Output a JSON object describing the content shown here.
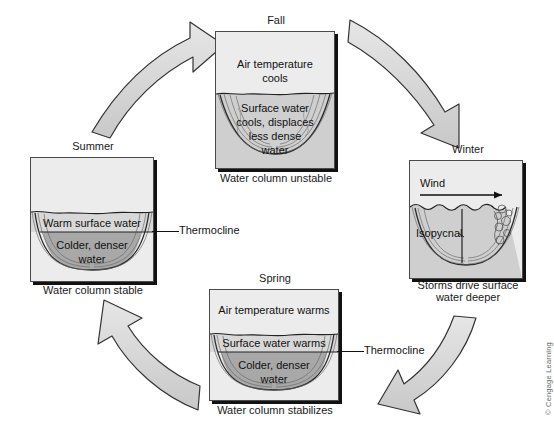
{
  "figure": {
    "copyright": "© Cengage Learning",
    "background": "#ffffff",
    "arrow_fill": "#d2d2d2",
    "arrow_stroke": "#333333",
    "sky_color": "#ececec",
    "mixed_water_color": "#cfcfcf",
    "warm_layer_color": "#d8d8d8",
    "cold_layer_color": "#a8a8a8"
  },
  "panels": {
    "fall": {
      "title": "Fall",
      "caption": "Water column unstable",
      "sky_text": "Air temperature\ncools",
      "sky_line1": "Air temperature",
      "sky_line2": "cools",
      "water_line1": "Surface water",
      "water_line2": "cools, displaces",
      "water_line3": "less dense",
      "water_line4": "water"
    },
    "winter": {
      "title": "Winter",
      "caption_line1": "Storms drive surface",
      "caption_line2": "water deeper",
      "wind_label": "Wind",
      "isopycnal_label": "Isopycnal"
    },
    "spring": {
      "title": "Spring",
      "caption": "Water column stabilizes",
      "sky_text": "Air temperature warms",
      "surface_text": "Surface water warms",
      "deep_line1": "Colder, denser",
      "deep_line2": "water",
      "thermocline_label": "Thermocline"
    },
    "summer": {
      "title": "Summer",
      "caption": "Water column stable",
      "surface_text": "Warm surface water",
      "deep_line1": "Colder, denser",
      "deep_line2": "water",
      "thermocline_label": "Thermocline"
    }
  },
  "arrows": [
    {
      "name": "summer-to-fall",
      "from": "Summer",
      "to": "Fall",
      "direction": "up-right"
    },
    {
      "name": "fall-to-winter",
      "from": "Fall",
      "to": "Winter",
      "direction": "down-right"
    },
    {
      "name": "winter-to-spring",
      "from": "Winter",
      "to": "Spring",
      "direction": "down-left"
    },
    {
      "name": "spring-to-summer",
      "from": "Spring",
      "to": "Summer",
      "direction": "up-left"
    }
  ]
}
